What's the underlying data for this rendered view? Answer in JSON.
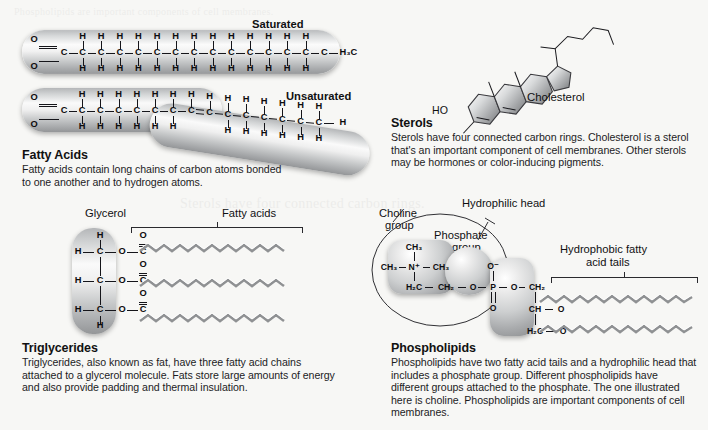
{
  "page": {
    "background_color": "#f7f7f5",
    "ghost_text_top": "Phospholipids are important components of cell membranes.",
    "ghost_text_mid": "Sterols have four connected carbon rings."
  },
  "sections": {
    "fatty_acids": {
      "heading": "Fatty Acids",
      "body": "Fatty acids contain long chains of carbon atoms bonded to one another and to hydrogen atoms.",
      "saturated_label": "Saturated",
      "unsaturated_label": "Unsaturated",
      "saturated": {
        "carboxyl_O_top": "O",
        "carboxyl_O_bottom": "O",
        "carbon": "C",
        "hydrogen": "H",
        "terminal": "H₃C",
        "carbon_count": 15,
        "hydrogen_top_count": 13,
        "hydrogen_bottom_count": 13
      },
      "unsaturated": {
        "carboxyl_O_top": "O",
        "carboxyl_O_bottom": "O",
        "carbon": "C",
        "hydrogen": "H",
        "terminal": "H",
        "double_bond_label": "=",
        "double_bond_position": 7,
        "carbon_count": 15
      }
    },
    "sterols": {
      "heading": "Sterols",
      "body": "Sterols have four connected carbon rings. Cholesterol is a sterol that's an important component of cell membranes. Other sterols may be hormones or color-inducing pigments.",
      "molecule_label": "Cholesterol",
      "hydroxyl_label": "HO",
      "ring_count": 4
    },
    "triglycerides": {
      "heading": "Triglycerides",
      "body": "Triglycerides, also known as fat, have three fatty acid chains attached to a glycerol molecule. Fats store large amounts of energy and also provide padding and thermal insulation.",
      "glycerol_label": "Glycerol",
      "fatty_acids_label": "Fatty acids",
      "tail_count": 3,
      "atoms": {
        "hydrogen": "H",
        "carbon": "C",
        "oxygen": "O"
      },
      "backbone_rows": [
        "H — C — O — C",
        "H — C — O — C",
        "H — C — O — C"
      ],
      "cap_top": "H",
      "cap_bottom": "H"
    },
    "phospholipids": {
      "heading": "Phospholipids",
      "body": "Phospholipids have two fatty acid tails and a hydrophilic head that includes a phosphate group. Different phospholipids have different groups attached to the phosphate. The one illustrated here is choline. Phospholipids are important components of cell membranes.",
      "hydrophilic_head_label": "Hydrophilic head",
      "choline_label_line1": "Choline",
      "choline_label_line2": "group",
      "phosphate_label_line1": "Phosphate",
      "phosphate_label_line2": "group",
      "glycerol_label": "Glycerol",
      "tails_label_line1": "Hydrophobic fatty",
      "tails_label_line2": "acid tails",
      "tail_count": 2,
      "choline_atoms": {
        "methyl_top": "CH₃",
        "methyl_left": "CH₃",
        "methyl_right": "CH₃",
        "nitrogen": "N⁺",
        "ch2_a": "H₂C",
        "ch2_b": "CH₂"
      },
      "phosphate_atoms": {
        "oxygen_minus": "O⁻",
        "oxygen_left": "O",
        "phosphorus": "P",
        "oxygen_right": "O",
        "oxygen_double": "O"
      },
      "glycerol_atoms": {
        "ch2_top": "CH₂",
        "ch_mid": "CH",
        "o_mid": "O",
        "h2c_bot": "H₂C",
        "o_bot": "O"
      }
    }
  }
}
